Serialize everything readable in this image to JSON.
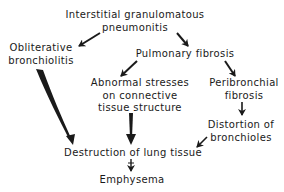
{
  "diagram": {
    "type": "flowchart",
    "colors": {
      "background": "#ffffff",
      "ink": "#1a1a1a"
    },
    "nodes": {
      "igp": {
        "line1": "Interstitial granulomatous",
        "line2": "pneumonitis"
      },
      "ob": {
        "line1": "Obliterative",
        "line2": "bronchiolitis"
      },
      "pf": {
        "line1": "Pulmonary fibrosis"
      },
      "as": {
        "line1": "Abnormal stresses",
        "line2": "on connective",
        "line3": "tissue structure"
      },
      "pbf": {
        "line1": "Peribronchial",
        "line2": "fibrosis"
      },
      "db": {
        "line1": "Distortion of",
        "line2": "bronchioles"
      },
      "dlt": {
        "line1": "Destruction of lung tissue"
      },
      "em": {
        "line1": "Emphysema"
      }
    },
    "edges": [
      {
        "from": "Interstitial granulomatous pneumonitis",
        "to": "Obliterative bronchiolitis"
      },
      {
        "from": "Interstitial granulomatous pneumonitis",
        "to": "Pulmonary fibrosis"
      },
      {
        "from": "Pulmonary fibrosis",
        "to": "Abnormal stresses on connective tissue structure"
      },
      {
        "from": "Pulmonary fibrosis",
        "to": "Peribronchial fibrosis"
      },
      {
        "from": "Peribronchial fibrosis",
        "to": "Distortion of bronchioles"
      },
      {
        "from": "Obliterative bronchiolitis",
        "to": "Destruction of lung tissue"
      },
      {
        "from": "Abnormal stresses on connective tissue structure",
        "to": "Destruction of lung tissue"
      },
      {
        "from": "Distortion of bronchioles",
        "to": "Destruction of lung tissue"
      },
      {
        "from": "Destruction of lung tissue",
        "to": "Emphysema"
      }
    ]
  }
}
